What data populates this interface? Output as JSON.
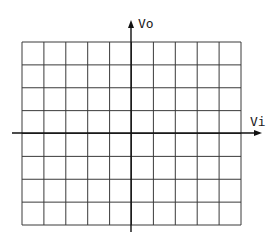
{
  "diagram": {
    "type": "transfer-characteristic-grid",
    "y_axis_label": "Vo",
    "x_axis_label": "Vi",
    "grid": {
      "columns": 10,
      "rows": 8,
      "left": 22,
      "top": 42,
      "right": 241,
      "bottom": 225
    },
    "axes": {
      "origin_x": 131,
      "origin_y": 133,
      "x_axis_start": 12,
      "x_axis_end": 262,
      "y_axis_top": 20,
      "y_axis_bottom": 232
    },
    "colors": {
      "grid_line": "#3a3a3a",
      "axis_line": "#111111",
      "background": "#ffffff"
    }
  }
}
